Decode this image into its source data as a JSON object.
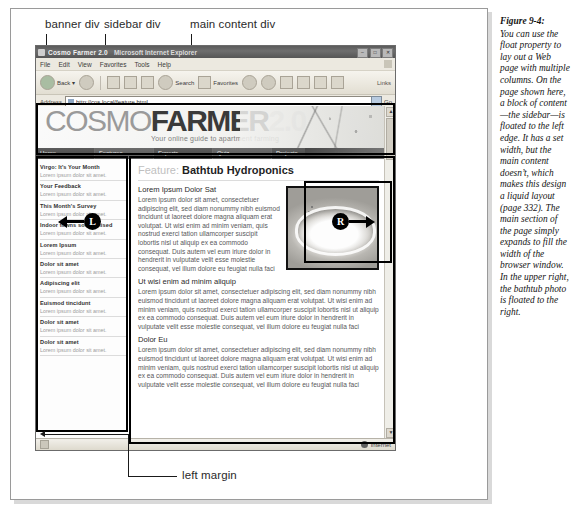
{
  "figure": {
    "title": "Figure 9-4:",
    "caption": "You can use the float property to lay out a Web page with multiple columns. On the page shown here, a block of content—the sidebar—is floated to the left edge. It has a set width, but the main content doesn’t, which makes this design a liquid layout (page 332). The main section of the page simply expands to fill the width of the browser window. In the upper right, the bathtub photo is floated to the right."
  },
  "callouts": {
    "banner": "banner div",
    "sidebar": "sidebar div",
    "main": "main content div",
    "left_margin": "left margin",
    "marker_left": "L",
    "marker_right": "R"
  },
  "browser": {
    "title": "Cosmo Farmer 2.0",
    "title_app": "Microsoft Internet Explorer",
    "window_buttons": [
      "–",
      "□",
      "✕"
    ],
    "menu": [
      "File",
      "Edit",
      "View",
      "Favorites",
      "Tools",
      "Help"
    ],
    "toolbar": {
      "back": "Back",
      "back_caret": "▾",
      "search": "Search",
      "favorites": "Favorites",
      "links_label": "Links"
    },
    "address": {
      "label": "Address",
      "url": "http://cos.local/feature.html",
      "go": "Go"
    },
    "status": {
      "zone": "Internet"
    }
  },
  "site": {
    "logo": {
      "part1": "COSMO",
      "part2": "FARMER",
      "part3": "2.0"
    },
    "tagline": "Your online guide to apartment farming",
    "nav": [
      "Home",
      "Features",
      "Experts",
      "Quiz",
      "Projects",
      "Horoscopes"
    ]
  },
  "sidebar": {
    "items": [
      {
        "heading": "Virgo: It's Your Month",
        "text": "Lorem ipsum dolor sit amet."
      },
      {
        "heading": "Your Feedback",
        "text": "Lorem ipsum dolor sit amet."
      },
      {
        "heading": "This Month's Survey",
        "text": "Lorem ipsum dolor sit amet."
      },
      {
        "heading": "Indoor towns sod or nised",
        "text": "Lorem ipsum dolor sit amet."
      },
      {
        "heading": "Lorem Ipsum",
        "text": "Lorem ipsum dolor sit amet."
      },
      {
        "heading": "Dolor sit amet",
        "text": "Lorem ipsum dolor sit amet."
      },
      {
        "heading": "Adipiscing elit",
        "text": "Lorem ipsum dolor sit amet."
      },
      {
        "heading": "Euismod tincidunt",
        "text": "Lorem ipsum dolor sit amet."
      },
      {
        "heading": "Dolor sit amet",
        "text": "Lorem ipsum dolor sit amet."
      },
      {
        "heading": "Dolor sit amet",
        "text": "Lorem ipsum dolor sit amet."
      }
    ]
  },
  "main": {
    "feature_prefix": "Feature:",
    "feature_title": "Bathtub Hydroponics",
    "sections": [
      {
        "heading": "Lorem Ipsum Dolor Sat",
        "body": "Lorem ipsum dolor sit amet, consectetuer adipiscing elit, sed diam nonummy nibh euismod tincidunt ut laoreet dolore magna aliquam erat volutpat. Ut wisi enim ad minim veniam, quis nostrud exerci tation ullamcorper suscipit lobortis nisl ut aliquip ex ea commodo consequat. Duis autem vel eum iriure dolor in hendrerit in vulputate velit esse molestie consequat, vel illum dolore eu feugiat nulla faci"
      },
      {
        "heading": "Ut wisi enim ad minim aliquip",
        "body": "Lorem ipsum dolor sit amet, consectetuer adipiscing elit, sed diam nonummy nibh euismod tincidunt ut laoreet dolore magna aliquam erat volutpat. Ut wisi enim ad minim veniam, quis nostrud exerci tation ullamcorper suscipit lobortis nisl ut aliquip ex ea commodo consequat. Duis autem vel eum iriure dolor in hendrerit in vulputate velit esse molestie consequat, vel illum dolore eu feugiat nulla faci"
      },
      {
        "heading": "Dolor Eu",
        "body": "Lorem ipsum dolor sit amet, consectetuer adipiscing elit, sed diam nonummy nibh euismod tincidunt ut laoreet dolore magna aliquam erat volutpat. Ut wisi enim ad minim veniam, quis nostrud exerci tation ullamcorper suscipit lobortis nisl ut aliquip ex ea commodo consequat. Duis autem vel eum iriure dolor in hendrerit in vulputate velit esse molestie consequat, vel illum dolore eu feugiat nulla faci"
      }
    ],
    "photo_alt": "bathtub photo"
  }
}
